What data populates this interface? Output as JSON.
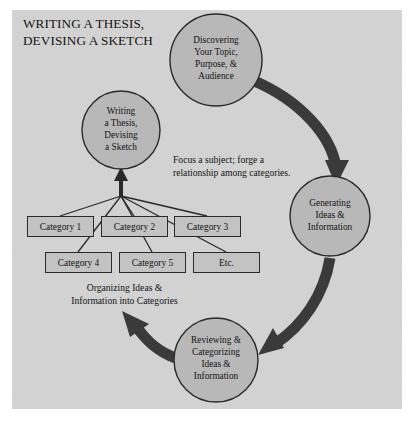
{
  "figure": {
    "title": "WRITING A THESIS,\nDEVISING A SKETCH",
    "title_line1": "WRITING A THESIS,",
    "title_line2": "DEVISING A SKETCH",
    "background_color": "#d3d3d3",
    "node_fill_color": "#b8b8b8",
    "arrow_color": "#3a3a3a",
    "outline_color": "#2a2a2a",
    "text_color": "#141414"
  },
  "circles": [
    {
      "id": "writing-a-thesis",
      "label": "Writing\na Thesis,\nDevising\na Sketch",
      "lines": [
        "Writing",
        "a Thesis,",
        "Devising",
        "a Sketch"
      ],
      "cx": 121,
      "cy": 130,
      "r": 39
    },
    {
      "id": "discovering-topic",
      "label": "Discovering\nYour Topic,\nPurpose, &\nAudience",
      "lines": [
        "Discovering",
        "Your Topic,",
        "Purpose, &",
        "Audience"
      ],
      "cx": 216,
      "cy": 60,
      "r": 46
    },
    {
      "id": "generating-ideas",
      "label": "Generating\nIdeas &\nInformation",
      "lines": [
        "Generating",
        "Ideas &",
        "Information"
      ],
      "cx": 330,
      "cy": 216,
      "r": 40
    },
    {
      "id": "reviewing-categorizing",
      "label": "Reviewing &\nCategorizing\nIdeas &\nInformation",
      "lines": [
        "Reviewing &",
        "Categorizing",
        "Ideas &",
        "Information"
      ],
      "cx": 216,
      "cy": 360,
      "r": 42
    }
  ],
  "boxes": [
    {
      "id": "category-1",
      "label": "Category 1",
      "x": 27,
      "y": 216,
      "w": 67,
      "h": 21
    },
    {
      "id": "category-2",
      "label": "Category 2",
      "x": 101,
      "y": 216,
      "w": 67,
      "h": 21
    },
    {
      "id": "category-3",
      "label": "Category 3",
      "x": 174,
      "y": 216,
      "w": 67,
      "h": 21
    },
    {
      "id": "category-4",
      "label": "Category 4",
      "x": 45,
      "y": 252,
      "w": 67,
      "h": 21
    },
    {
      "id": "category-5",
      "label": "Category 5",
      "x": 119,
      "y": 252,
      "w": 67,
      "h": 21
    },
    {
      "id": "etc",
      "label": "Etc.",
      "x": 193,
      "y": 252,
      "w": 67,
      "h": 21
    }
  ],
  "captions": {
    "focus": "Focus a subject; forge a relationship among categories.",
    "focus_line1": "Focus a subject; forge a",
    "focus_line2": "relationship among categories.",
    "organizing": "Organizing Ideas & Information into Categories",
    "organizing_line1": "Organizing Ideas &",
    "organizing_line2": "Information into Categories"
  },
  "arrows": [
    {
      "id": "discovering-to-generating",
      "from": "discovering-topic",
      "to": "generating-ideas",
      "style": "thick-curved"
    },
    {
      "id": "generating-to-reviewing",
      "from": "generating-ideas",
      "to": "reviewing-categorizing",
      "style": "thick-curved"
    },
    {
      "id": "reviewing-to-categories",
      "from": "reviewing-categorizing",
      "to": "organizing-caption",
      "style": "thick-curved"
    },
    {
      "id": "categories-to-thesis",
      "from": "category-boxes",
      "to": "writing-a-thesis",
      "style": "thin-converging"
    }
  ]
}
